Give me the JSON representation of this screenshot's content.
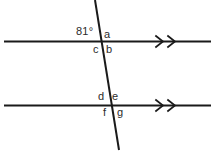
{
  "diagram": {
    "type": "parallel-lines-transversal",
    "background_color": "#ffffff",
    "stroke_color": "#1a1a1a",
    "text_color": "#2b2b2b",
    "angle_measure": {
      "value": "81",
      "unit": "°",
      "display": "81°",
      "position": "upper-left-of-top-intersection"
    },
    "angle_labels": {
      "a": "a",
      "b": "b",
      "c": "c",
      "d": "d",
      "e": "e",
      "f": "f",
      "g": "g"
    },
    "lines": {
      "top_parallel": {
        "name": "top-parallel-line",
        "x1": 4,
        "y1": 41,
        "x2": 211,
        "y2": 41,
        "arrow_marks": 2
      },
      "bottom_parallel": {
        "name": "bottom-parallel-line",
        "x1": 4,
        "y1": 105,
        "x2": 211,
        "y2": 105,
        "arrow_marks": 2
      },
      "transversal": {
        "name": "transversal-line",
        "x1": 95,
        "y1": 0,
        "x2": 119,
        "y2": 150
      }
    },
    "chevrons": {
      "top": [
        {
          "x": 160,
          "y": 41
        },
        {
          "x": 172,
          "y": 41
        }
      ],
      "bottom": [
        {
          "x": 160,
          "y": 105
        },
        {
          "x": 172,
          "y": 105
        }
      ]
    },
    "intersections": {
      "top": {
        "x": 101.5,
        "y": 41
      },
      "bottom": {
        "x": 111.8,
        "y": 105
      }
    }
  }
}
